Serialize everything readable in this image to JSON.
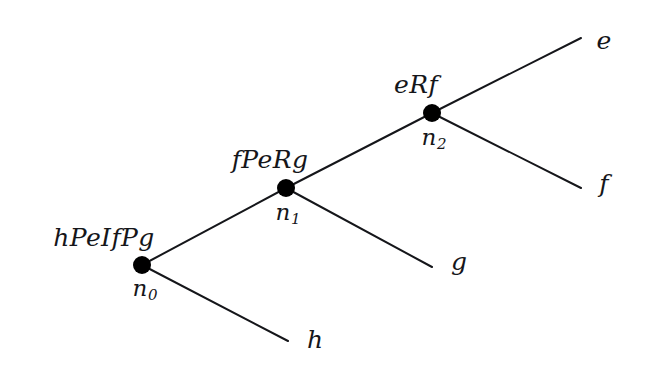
{
  "figure": {
    "type": "tree-diagram",
    "title": "",
    "background_color": "#ffffff",
    "stroke_color": "#15161a",
    "node_fill_color": "#000000"
  },
  "nodes": [
    {
      "id": "n0",
      "name": "n",
      "subscript": "0",
      "expression": "hPeIfPg",
      "x": 142,
      "y": 265,
      "radius": 9,
      "expr_x": 104,
      "expr_y": 237,
      "name_x": 145,
      "name_y": 290
    },
    {
      "id": "n1",
      "name": "n",
      "subscript": "1",
      "expression": "fPeRg",
      "x": 286,
      "y": 188,
      "radius": 9,
      "expr_x": 270,
      "expr_y": 159,
      "name_x": 288,
      "name_y": 214
    },
    {
      "id": "n2",
      "name": "n",
      "subscript": "2",
      "expression": "eRf",
      "x": 432,
      "y": 113,
      "radius": 9,
      "expr_x": 416,
      "expr_y": 84,
      "name_x": 434,
      "name_y": 139
    }
  ],
  "leaves": [
    {
      "id": "leaf-e",
      "label": "e",
      "x": 604,
      "y": 40,
      "tip_x": 581,
      "tip_y": 38
    },
    {
      "id": "leaf-f",
      "label": "f",
      "x": 604,
      "y": 183,
      "tip_x": 581,
      "tip_y": 188
    },
    {
      "id": "leaf-g",
      "label": "g",
      "x": 459,
      "y": 261,
      "tip_x": 432,
      "tip_y": 267
    },
    {
      "id": "leaf-h",
      "label": "h",
      "x": 315,
      "y": 339,
      "tip_x": 288,
      "tip_y": 341
    }
  ],
  "edges": [
    {
      "id": "edge-n0-n1",
      "from": "n0",
      "to": "n1",
      "x1": 142,
      "y1": 265,
      "x2": 286,
      "y2": 188
    },
    {
      "id": "edge-n0-h",
      "from": "n0",
      "to": "leaf-h",
      "x1": 142,
      "y1": 265,
      "x2": 288,
      "y2": 341
    },
    {
      "id": "edge-n1-n2",
      "from": "n1",
      "to": "n2",
      "x1": 286,
      "y1": 188,
      "x2": 432,
      "y2": 113
    },
    {
      "id": "edge-n1-g",
      "from": "n1",
      "to": "leaf-g",
      "x1": 286,
      "y1": 188,
      "x2": 432,
      "y2": 267
    },
    {
      "id": "edge-n2-e",
      "from": "n2",
      "to": "leaf-e",
      "x1": 432,
      "y1": 113,
      "x2": 581,
      "y2": 38
    },
    {
      "id": "edge-n2-f",
      "from": "n2",
      "to": "leaf-f",
      "x1": 432,
      "y1": 113,
      "x2": 581,
      "y2": 188
    }
  ]
}
